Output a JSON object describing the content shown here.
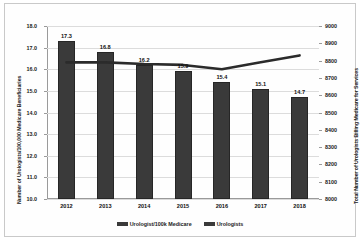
{
  "chart_data": {
    "type": "bar",
    "title": "",
    "xlabel": "",
    "categories": [
      "2012",
      "2013",
      "2014",
      "2015",
      "2016",
      "2017",
      "2018"
    ],
    "grid": true,
    "legend_position": "bottom",
    "series": [
      {
        "name": "Urologist/100k Medicare",
        "type": "bar",
        "axis": "left",
        "values": [
          17.3,
          16.8,
          16.2,
          15.9,
          15.4,
          15.1,
          14.7
        ],
        "labels": [
          "17.3",
          "16.8",
          "16.2",
          "15.9",
          "15.4",
          "15.1",
          "14.7"
        ],
        "color": "#3a3a3a"
      },
      {
        "name": "Urologists",
        "type": "line",
        "axis": "right",
        "values": [
          8790,
          8790,
          8780,
          8775,
          8750,
          8790,
          8830
        ],
        "color": "#2b2b2b"
      }
    ],
    "axes": {
      "left": {
        "label": "Number of Urologists/100,000 Medicare Beneficiaries",
        "min": 10.0,
        "max": 18.0,
        "step": 1.0,
        "ticks": [
          "18.0",
          "17.0",
          "16.0",
          "15.0",
          "14.0",
          "13.0",
          "12.0",
          "11.0",
          "10.0"
        ]
      },
      "right": {
        "label": "Total Number of Urologists Billing Medicare for Services",
        "min": 8000,
        "max": 9000,
        "step": 100,
        "ticks": [
          "9000",
          "8900",
          "8800",
          "8700",
          "8600",
          "8500",
          "8400",
          "8300",
          "8200",
          "8100",
          "8000"
        ]
      }
    },
    "legend": [
      {
        "label": "Urologist/100k Medicare",
        "color": "#3a3a3a"
      },
      {
        "label": "Urologists",
        "color": "#3a3a3a"
      }
    ]
  }
}
